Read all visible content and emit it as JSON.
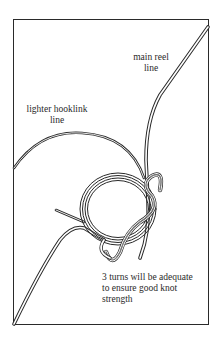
{
  "figure": {
    "labels": {
      "main_reel_line": [
        "main reel",
        "line"
      ],
      "lighter_hooklink_line": [
        "lighter hooklink",
        "line"
      ],
      "turns_note": [
        "3 turns will be adequate",
        "to ensure good knot",
        "strength"
      ]
    },
    "colors": {
      "ink": "#2a2a2a",
      "background": "#ffffff"
    }
  }
}
